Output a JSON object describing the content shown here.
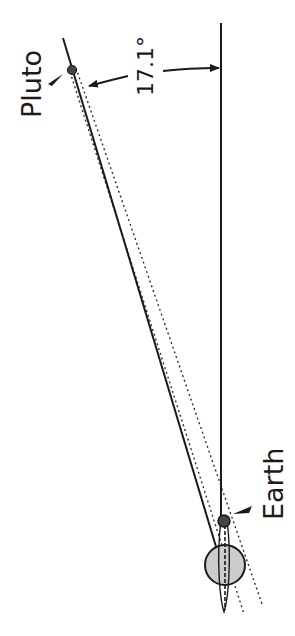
{
  "diagram": {
    "angle_label": "17.1°",
    "labels": {
      "pluto": "Pluto",
      "earth": "Earth"
    },
    "colors": {
      "line": "#1a1a1a",
      "dotted": "#333333",
      "body_dark": "#444444",
      "sun_fill": "#cccccc",
      "background": "#ffffff"
    },
    "elements": {
      "pluto_body": "small dark circle",
      "earth_body": "small dark circle",
      "sun_body": "large light gray circle",
      "sight_line": "solid line from Pluto to Sun",
      "reference_line": "vertical solid line",
      "tolerance_lines": "two dotted lines flanking sight line",
      "angle_arrow": "curved arrow indicating angle"
    }
  }
}
